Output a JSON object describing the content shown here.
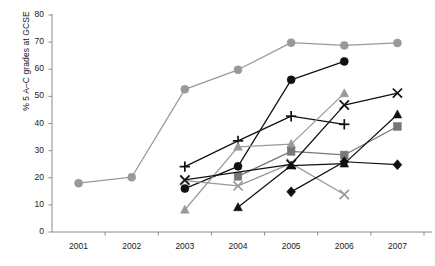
{
  "chart_data": {
    "type": "line",
    "title": "",
    "xlabel": "",
    "ylabel": "% 5 A–C grades at GCSE",
    "categories": [
      "2001",
      "2002",
      "2003",
      "2004",
      "2005",
      "2006",
      "2007"
    ],
    "ylim": [
      0,
      80
    ],
    "yticks": [
      0,
      10,
      20,
      30,
      40,
      50,
      60,
      70,
      80
    ],
    "grid": false,
    "legend": "none",
    "series": [
      {
        "name": "school-1",
        "marker": "circle",
        "color": "#999999",
        "x": [
          "2001",
          "2002",
          "2003",
          "2004",
          "2005",
          "2006",
          "2007"
        ],
        "values": [
          18,
          20.2,
          52.6,
          59.8,
          69.8,
          68.8,
          69.7
        ]
      },
      {
        "name": "school-2",
        "marker": "circle",
        "color": "#111111",
        "x": [
          "2003",
          "2004",
          "2005",
          "2006"
        ],
        "values": [
          16,
          24.2,
          56.1,
          62.9
        ]
      },
      {
        "name": "school-3",
        "marker": "plus",
        "color": "#111111",
        "x": [
          "2003",
          "2004",
          "2005",
          "2006"
        ],
        "values": [
          24.1,
          33.6,
          42.7,
          39.7
        ]
      },
      {
        "name": "school-4",
        "marker": "triangle",
        "color": "#999999",
        "x": [
          "2003",
          "2004",
          "2005",
          "2006"
        ],
        "values": [
          8.2,
          31.4,
          32.4,
          51.1
        ]
      },
      {
        "name": "school-5",
        "marker": "square",
        "color": "#777777",
        "x": [
          "2004",
          "2005",
          "2006",
          "2007"
        ],
        "values": [
          20.5,
          29.7,
          28.4,
          38.9
        ]
      },
      {
        "name": "school-6",
        "marker": "x",
        "color": "#999999",
        "x": [
          "2003",
          "2004",
          "2005",
          "2006"
        ],
        "values": [
          18.9,
          17,
          25.3,
          13.8
        ]
      },
      {
        "name": "school-7",
        "marker": "triangle",
        "color": "#111111",
        "x": [
          "2004",
          "2005",
          "2006",
          "2007"
        ],
        "values": [
          9.1,
          24.5,
          25.2,
          43.3
        ]
      },
      {
        "name": "school-8",
        "marker": "x",
        "color": "#111111",
        "x": [
          "2003",
          "2005",
          "2006",
          "2007"
        ],
        "values": [
          19.2,
          24.9,
          46.8,
          51.2
        ]
      },
      {
        "name": "school-9",
        "marker": "diamond",
        "color": "#111111",
        "x": [
          "2005",
          "2006",
          "2007"
        ],
        "values": [
          14.8,
          25.9,
          24.8
        ]
      }
    ]
  },
  "axes": {
    "y_axis_label": "% 5 A–C grades at GCSE",
    "y_tick_labels": [
      "0",
      "10",
      "20",
      "30",
      "40",
      "50",
      "60",
      "70",
      "80"
    ],
    "x_tick_labels": [
      "2001",
      "2002",
      "2003",
      "2004",
      "2005",
      "2006",
      "2007"
    ]
  }
}
